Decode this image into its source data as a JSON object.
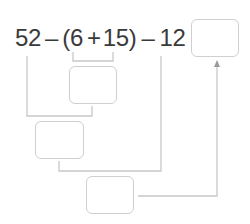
{
  "equation": {
    "n1": "52",
    "op1": "–",
    "open_paren": "(",
    "n2": "6",
    "op2": "+",
    "n3": "15",
    "close_paren": ")",
    "op3": "–",
    "n4": "12",
    "equals": "="
  },
  "boxes": [
    {
      "id": "answer-box",
      "value": ""
    },
    {
      "id": "step1-box",
      "value": ""
    },
    {
      "id": "step2-box",
      "value": ""
    },
    {
      "id": "step3-box",
      "value": ""
    }
  ],
  "colors": {
    "text": "#3a3a3a",
    "lines": "#c8c8c8",
    "box_border": "#cfcfcf"
  }
}
